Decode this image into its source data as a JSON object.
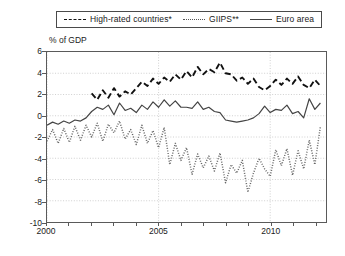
{
  "chart_data": {
    "type": "line",
    "title": "",
    "xlabel": "",
    "ylabel": "% of GDP",
    "ylabel_text": "% of GDP",
    "xlim": [
      2000,
      2012.5
    ],
    "ylim": [
      -10,
      6
    ],
    "yticks": [
      6,
      4,
      2,
      0,
      -2,
      -4,
      -6,
      -8,
      -10
    ],
    "ytick_labels": [
      "6",
      "4",
      "2",
      "0",
      "-2",
      "-4",
      "-6",
      "-8",
      "-10"
    ],
    "xticks": [
      2000,
      2001,
      2002,
      2003,
      2004,
      2005,
      2006,
      2007,
      2008,
      2009,
      2010,
      2011,
      2012
    ],
    "xtick_labels_shown": [
      "2000",
      "2005",
      "2010"
    ],
    "xtick_labels_positions": [
      2000,
      2005,
      2010
    ],
    "grid": true,
    "grid_style": "dotted",
    "legend_position": "above-plot",
    "series": [
      {
        "name": "High-rated countries*",
        "style": "dashed",
        "color": "#111111",
        "x": [
          2002.0,
          2002.25,
          2002.5,
          2002.75,
          2003.0,
          2003.25,
          2003.5,
          2003.75,
          2004.0,
          2004.25,
          2004.5,
          2004.75,
          2005.0,
          2005.25,
          2005.5,
          2005.75,
          2006.0,
          2006.25,
          2006.5,
          2006.75,
          2007.0,
          2007.25,
          2007.5,
          2007.75,
          2008.0,
          2008.25,
          2008.5,
          2008.75,
          2009.0,
          2009.25,
          2009.5,
          2009.75,
          2010.0,
          2010.25,
          2010.5,
          2010.75,
          2011.0,
          2011.25,
          2011.5,
          2011.75,
          2012.0,
          2012.25
        ],
        "values": [
          2.1,
          1.5,
          2.4,
          1.7,
          2.6,
          1.8,
          2.3,
          2.0,
          2.6,
          3.2,
          2.8,
          3.5,
          3.0,
          3.6,
          3.2,
          3.9,
          3.4,
          4.2,
          3.6,
          4.6,
          3.9,
          4.4,
          4.1,
          5.0,
          4.0,
          3.9,
          3.3,
          3.6,
          3.0,
          3.5,
          2.7,
          2.4,
          2.8,
          3.4,
          2.9,
          3.5,
          3.0,
          3.7,
          2.9,
          2.6,
          3.4,
          2.8
        ]
      },
      {
        "name": "Euro area",
        "style": "solid",
        "color": "#444444",
        "x": [
          2000.0,
          2000.25,
          2000.5,
          2000.75,
          2001.0,
          2001.25,
          2001.5,
          2001.75,
          2002.0,
          2002.25,
          2002.5,
          2002.75,
          2003.0,
          2003.25,
          2003.5,
          2003.75,
          2004.0,
          2004.25,
          2004.5,
          2004.75,
          2005.0,
          2005.25,
          2005.5,
          2005.75,
          2006.0,
          2006.25,
          2006.5,
          2006.75,
          2007.0,
          2007.25,
          2007.5,
          2007.75,
          2008.0,
          2008.25,
          2008.5,
          2008.75,
          2009.0,
          2009.25,
          2009.5,
          2009.75,
          2010.0,
          2010.25,
          2010.5,
          2010.75,
          2011.0,
          2011.25,
          2011.5,
          2011.75,
          2012.0,
          2012.25
        ],
        "values": [
          -0.9,
          -0.6,
          -0.8,
          -0.5,
          -0.7,
          -0.4,
          -0.5,
          -0.2,
          0.4,
          0.8,
          0.6,
          1.0,
          0.1,
          1.2,
          0.5,
          0.7,
          0.3,
          1.0,
          0.6,
          1.3,
          0.8,
          1.5,
          0.9,
          1.4,
          0.8,
          0.8,
          0.7,
          1.3,
          0.6,
          0.8,
          0.4,
          0.3,
          -0.4,
          -0.5,
          -0.6,
          -0.5,
          -0.4,
          -0.2,
          0.2,
          0.9,
          0.3,
          0.6,
          0.5,
          1.0,
          0.2,
          0.4,
          -0.2,
          1.6,
          0.6,
          1.2
        ]
      },
      {
        "name": "GIIPS**",
        "style": "dotted",
        "color": "#666666",
        "x": [
          2000.0,
          2000.25,
          2000.5,
          2000.75,
          2001.0,
          2001.25,
          2001.5,
          2001.75,
          2002.0,
          2002.25,
          2002.5,
          2002.75,
          2003.0,
          2003.25,
          2003.5,
          2003.75,
          2004.0,
          2004.25,
          2004.5,
          2004.75,
          2005.0,
          2005.25,
          2005.5,
          2005.75,
          2006.0,
          2006.25,
          2006.5,
          2006.75,
          2007.0,
          2007.25,
          2007.5,
          2007.75,
          2008.0,
          2008.25,
          2008.5,
          2008.75,
          2009.0,
          2009.25,
          2009.5,
          2009.75,
          2010.0,
          2010.25,
          2010.5,
          2010.75,
          2011.0,
          2011.25,
          2011.5,
          2011.75,
          2012.0,
          2012.25
        ],
        "values": [
          -2.4,
          -1.3,
          -2.6,
          -1.2,
          -2.5,
          -1.0,
          -2.3,
          -0.9,
          -2.0,
          -0.7,
          -2.4,
          -0.8,
          -1.6,
          -0.5,
          -2.2,
          -1.3,
          -2.7,
          -0.9,
          -2.6,
          -1.4,
          -3.0,
          -1.1,
          -4.6,
          -2.6,
          -4.2,
          -3.0,
          -5.5,
          -3.6,
          -4.9,
          -3.8,
          -5.2,
          -3.5,
          -6.3,
          -4.6,
          -5.4,
          -4.2,
          -7.2,
          -5.4,
          -4.0,
          -5.0,
          -5.7,
          -3.2,
          -4.7,
          -3.1,
          -5.6,
          -3.3,
          -5.0,
          -2.3,
          -4.6,
          -1.0
        ]
      }
    ],
    "legend": [
      {
        "label": "High-rated countries*",
        "style": "dashed",
        "icon": "dashed-line-key"
      },
      {
        "label": "GIIPS**",
        "style": "dotted",
        "icon": "dotted-line-key"
      },
      {
        "label": "Euro area",
        "style": "solid",
        "icon": "solid-line-key"
      }
    ]
  }
}
